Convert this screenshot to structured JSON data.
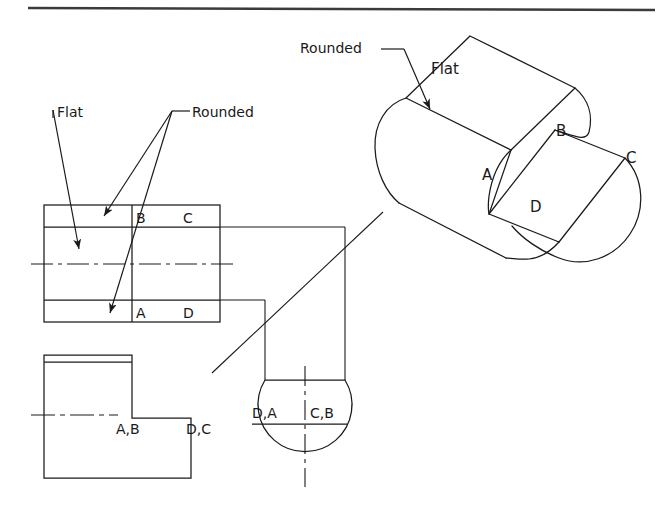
{
  "sheet": {
    "title": "Orthographic and Isometric Views of a Flatted Cylinder",
    "background_color": "#ffffff",
    "line_color": "#1a1a1a",
    "width": 672,
    "height": 514,
    "header_rule": {
      "x1": 28,
      "y1": 7,
      "x2": 655,
      "y2": 9
    }
  },
  "isometric_view": {
    "name": "pictorial-isometric-view",
    "labels": {
      "flat": "Flat",
      "rounded": "Rounded",
      "corner_a": "A",
      "corner_b": "B",
      "corner_c": "C",
      "corner_d": "D"
    },
    "label_positions": {
      "flat": {
        "x": 431,
        "y": 74
      },
      "rounded": {
        "x": 300,
        "y": 53
      },
      "corner_a": {
        "x": 482,
        "y": 180
      },
      "corner_b": {
        "x": 556,
        "y": 136
      },
      "corner_c": {
        "x": 626,
        "y": 163
      },
      "corner_d": {
        "x": 530,
        "y": 212
      }
    }
  },
  "top_view": {
    "name": "top-view",
    "labels": {
      "corner_a": "A",
      "corner_b": "B",
      "corner_c": "C",
      "corner_d": "D",
      "flat": "Flat",
      "rounded": "Rounded"
    },
    "label_positions": {
      "corner_b": {
        "x": 140,
        "y": 220
      },
      "corner_c": {
        "x": 186,
        "y": 220
      },
      "corner_a": {
        "x": 140,
        "y": 318
      },
      "corner_d": {
        "x": 186,
        "y": 318
      },
      "flat": {
        "x": 57,
        "y": 117
      },
      "rounded": {
        "x": 192,
        "y": 117
      }
    },
    "outline": {
      "x": 44,
      "y": 205,
      "width": 176,
      "height": 117
    }
  },
  "front_view": {
    "name": "front-view",
    "labels": {
      "edge_ab": "A,B",
      "edge_dc": "D,C"
    },
    "label_positions": {
      "edge_ab": {
        "x": 122,
        "y": 432
      },
      "edge_dc": {
        "x": 192,
        "y": 432
      }
    },
    "outline": {
      "x": 44,
      "y": 355,
      "width": 147,
      "height": 123
    }
  },
  "side_view": {
    "name": "right-side-view",
    "labels": {
      "edge_da": "D,A",
      "edge_cb": "C,B"
    },
    "label_positions": {
      "edge_da": {
        "x": 254,
        "y": 414
      },
      "edge_cb": {
        "x": 308,
        "y": 414
      }
    },
    "circle": {
      "cx": 299,
      "cy": 424,
      "r": 47
    }
  },
  "projection": {
    "name": "miter-projection-lines",
    "miter_line": {
      "x1": 212,
      "y1": 373,
      "x2": 383,
      "y2": 212
    }
  }
}
